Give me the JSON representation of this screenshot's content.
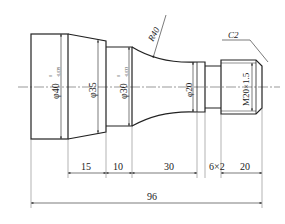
{
  "drawing": {
    "type": "shaft-part-drawing",
    "line_color": "#222222",
    "background": "#ffffff",
    "diameters": {
      "d40": {
        "label": "φ40",
        "tol_upper": "0",
        "tol_lower": "-0.039"
      },
      "d35": {
        "label": "φ35"
      },
      "d30": {
        "label": "φ30",
        "tol_upper": "0",
        "tol_lower": "-0.033"
      },
      "d20": {
        "label": "φ20"
      }
    },
    "thread": {
      "label": "M20×1.5"
    },
    "chamfer": {
      "label": "C2"
    },
    "radius": {
      "label": "R40"
    },
    "lengths": {
      "l15": "15",
      "l10": "10",
      "l30": "30",
      "groove": "6×2",
      "l20": "20",
      "total": "96"
    }
  }
}
